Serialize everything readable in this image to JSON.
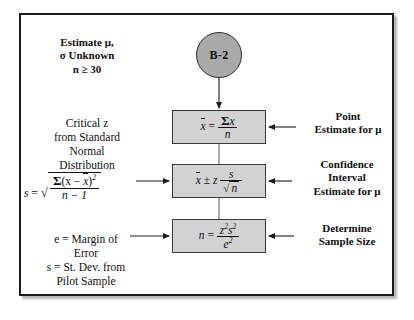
{
  "figure": {
    "node_label": "B-2",
    "left_blocks": {
      "estimate": [
        "Estimate μ,",
        "σ Unknown",
        "n ≥ 30"
      ],
      "critical_z": [
        "Critical z",
        "from Standard",
        "Normal",
        "Distribution"
      ],
      "margin_error": [
        "e = Margin of",
        "Error",
        "s = St. Dev. from",
        "Pilot Sample"
      ]
    },
    "right_labels": {
      "point": [
        "Point",
        "Estimate for μ"
      ],
      "confidence": [
        "Confidence",
        "Interval",
        "Estimate for μ"
      ],
      "determine": [
        "Determine",
        "Sample Size"
      ]
    },
    "formulas": {
      "mean": "x̄ = Σx / n",
      "confidence_interval": "x̄ ± z s/√n",
      "sample_size": "n = z²s² / e²",
      "std_dev": "s = √( Σ(x − x̄)² / (n − 1) )"
    },
    "formula_parts": {
      "xbar": "x",
      "equals": "=",
      "plusminus": "±",
      "sum": "Σ",
      "n": "n",
      "x": "x",
      "z": "z",
      "s": "s",
      "e": "e",
      "n_minus_1": "n − 1",
      "s_lhs": "s",
      "x_minus": "(x − ",
      "close_paren": ")",
      "exp2": "2",
      "z_sq_s_sq_num_z": "z",
      "z_sq_s_sq_num_s": "s",
      "e_den": "e"
    },
    "colors": {
      "box_fill": "#d2d2d2",
      "circle_fill": "#a9a9a9",
      "border": "#3a3a3a",
      "frame": "#1b1b1b",
      "line": "#222222"
    }
  }
}
